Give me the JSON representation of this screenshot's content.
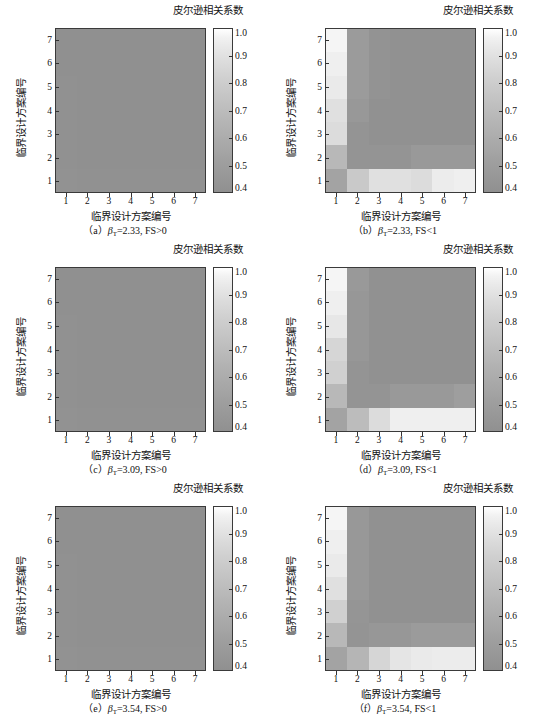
{
  "figure": {
    "width": 539,
    "height": 716,
    "background": "#ffffff"
  },
  "common": {
    "colorbar_title": "皮尔逊相关系数",
    "xlabel": "临界设计方案编号",
    "ylabel": "临界设计方案编号",
    "xticks": [
      "1",
      "2",
      "3",
      "4",
      "5",
      "6",
      "7"
    ],
    "yticks": [
      "1",
      "2",
      "3",
      "4",
      "5",
      "6",
      "7"
    ],
    "cb_ticks": [
      "1.0",
      "0.9",
      "0.8",
      "0.7",
      "0.6",
      "0.5",
      "0.4"
    ],
    "cmap_low_color": "#ffffff",
    "cmap_high_color": "#909090",
    "axes_color": "#3a3a3a"
  },
  "chart_data": [
    {
      "id": "a",
      "type": "heatmap",
      "title": "（a）β_T=2.33, FS>0",
      "caption_prefix": "（a）",
      "caption_beta": "β",
      "caption_beta_sub": "T",
      "caption_rest": "=2.33, FS>0",
      "xlabel": "临界设计方案编号",
      "ylabel": "临界设计方案编号",
      "xticklabels": [
        "1",
        "2",
        "3",
        "4",
        "5",
        "6",
        "7"
      ],
      "yticklabels": [
        "1",
        "2",
        "3",
        "4",
        "5",
        "6",
        "7"
      ],
      "zlim": [
        0.4,
        1.0
      ],
      "colorbar_label": "皮尔逊相关系数",
      "rows_top_to_bottom": [
        7,
        6,
        5,
        4,
        3,
        2,
        1
      ],
      "values": [
        [
          1.0,
          1.0,
          1.0,
          1.0,
          1.0,
          1.0,
          1.0
        ],
        [
          1.0,
          1.0,
          1.0,
          1.0,
          1.0,
          1.0,
          1.0
        ],
        [
          0.995,
          1.0,
          1.0,
          1.0,
          1.0,
          1.0,
          1.0
        ],
        [
          0.995,
          1.0,
          1.0,
          1.0,
          1.0,
          1.0,
          1.0
        ],
        [
          0.99,
          1.0,
          1.0,
          1.0,
          1.0,
          1.0,
          1.0
        ],
        [
          0.99,
          1.0,
          1.0,
          1.0,
          1.0,
          1.0,
          1.0
        ],
        [
          0.985,
          0.99,
          0.99,
          0.99,
          0.99,
          0.99,
          0.99
        ]
      ]
    },
    {
      "id": "b",
      "type": "heatmap",
      "title": "（b）β_T=2.33, FS<1",
      "caption_prefix": "（b）",
      "caption_beta": "β",
      "caption_beta_sub": "T",
      "caption_rest": "=2.33, FS<1",
      "xlabel": "临界设计方案编号",
      "ylabel": "临界设计方案编号",
      "xticklabels": [
        "1",
        "2",
        "3",
        "4",
        "5",
        "6",
        "7"
      ],
      "yticklabels": [
        "1",
        "2",
        "3",
        "4",
        "5",
        "6",
        "7"
      ],
      "zlim": [
        0.4,
        1.0
      ],
      "colorbar_label": "皮尔逊相关系数",
      "rows_top_to_bottom": [
        7,
        6,
        5,
        4,
        3,
        2,
        1
      ],
      "values": [
        [
          0.42,
          0.92,
          0.98,
          0.99,
          0.99,
          0.99,
          0.99
        ],
        [
          0.44,
          0.92,
          0.98,
          0.99,
          0.99,
          0.99,
          0.99
        ],
        [
          0.46,
          0.92,
          0.98,
          0.99,
          0.99,
          0.99,
          0.99
        ],
        [
          0.5,
          0.94,
          0.99,
          0.99,
          0.99,
          0.99,
          0.99
        ],
        [
          0.52,
          0.97,
          0.99,
          0.99,
          0.99,
          0.99,
          0.99
        ],
        [
          0.72,
          0.97,
          0.97,
          0.97,
          0.93,
          0.93,
          0.93
        ],
        [
          0.86,
          0.62,
          0.5,
          0.5,
          0.52,
          0.45,
          0.44
        ]
      ]
    },
    {
      "id": "c",
      "type": "heatmap",
      "title": "（c）β_T=3.09, FS>0",
      "caption_prefix": "（c）",
      "caption_beta": "β",
      "caption_beta_sub": "T",
      "caption_rest": "=3.09, FS>0",
      "xlabel": "临界设计方案编号",
      "ylabel": "临界设计方案编号",
      "xticklabels": [
        "1",
        "2",
        "3",
        "4",
        "5",
        "6",
        "7"
      ],
      "yticklabels": [
        "1",
        "2",
        "3",
        "4",
        "5",
        "6",
        "7"
      ],
      "zlim": [
        0.4,
        1.0
      ],
      "colorbar_label": "皮尔逊相关系数",
      "rows_top_to_bottom": [
        7,
        6,
        5,
        4,
        3,
        2,
        1
      ],
      "values": [
        [
          1.0,
          1.0,
          1.0,
          1.0,
          1.0,
          1.0,
          1.0
        ],
        [
          1.0,
          1.0,
          1.0,
          1.0,
          1.0,
          1.0,
          1.0
        ],
        [
          0.995,
          1.0,
          1.0,
          1.0,
          1.0,
          1.0,
          1.0
        ],
        [
          0.995,
          1.0,
          1.0,
          1.0,
          1.0,
          1.0,
          1.0
        ],
        [
          0.99,
          1.0,
          1.0,
          1.0,
          1.0,
          1.0,
          1.0
        ],
        [
          0.99,
          1.0,
          1.0,
          1.0,
          1.0,
          1.0,
          1.0
        ],
        [
          0.985,
          0.99,
          0.99,
          0.99,
          0.99,
          0.99,
          0.99
        ]
      ]
    },
    {
      "id": "d",
      "type": "heatmap",
      "title": "（d）β_T=3.09, FS<1",
      "caption_prefix": "（d）",
      "caption_beta": "β",
      "caption_beta_sub": "T",
      "caption_rest": "=3.09, FS<1",
      "xlabel": "临界设计方案编号",
      "ylabel": "临界设计方案编号",
      "xticklabels": [
        "1",
        "2",
        "3",
        "4",
        "5",
        "6",
        "7"
      ],
      "yticklabels": [
        "1",
        "2",
        "3",
        "4",
        "5",
        "6",
        "7"
      ],
      "zlim": [
        0.4,
        1.0
      ],
      "colorbar_label": "皮尔逊相关系数",
      "rows_top_to_bottom": [
        7,
        6,
        5,
        4,
        3,
        2,
        1
      ],
      "values": [
        [
          0.42,
          0.93,
          0.99,
          0.99,
          0.99,
          0.99,
          0.99
        ],
        [
          0.44,
          0.95,
          0.99,
          0.99,
          0.99,
          0.99,
          0.99
        ],
        [
          0.47,
          0.95,
          0.99,
          0.99,
          0.99,
          0.99,
          0.99
        ],
        [
          0.55,
          0.95,
          0.99,
          0.99,
          0.99,
          0.99,
          0.99
        ],
        [
          0.58,
          0.97,
          0.99,
          0.99,
          0.99,
          0.99,
          0.99
        ],
        [
          0.72,
          0.97,
          0.97,
          0.93,
          0.93,
          0.93,
          0.9
        ],
        [
          0.86,
          0.7,
          0.52,
          0.44,
          0.44,
          0.44,
          0.44
        ]
      ]
    },
    {
      "id": "e",
      "type": "heatmap",
      "title": "（e）β_T=3.54, FS>0",
      "caption_prefix": "（e）",
      "caption_beta": "β",
      "caption_beta_sub": "T",
      "caption_rest": "=3.54, FS>0",
      "xlabel": "临界设计方案编号",
      "ylabel": "临界设计方案编号",
      "xticklabels": [
        "1",
        "2",
        "3",
        "4",
        "5",
        "6",
        "7"
      ],
      "yticklabels": [
        "1",
        "2",
        "3",
        "4",
        "5",
        "6",
        "7"
      ],
      "zlim": [
        0.4,
        1.0
      ],
      "colorbar_label": "皮尔逊相关系数",
      "rows_top_to_bottom": [
        7,
        6,
        5,
        4,
        3,
        2,
        1
      ],
      "values": [
        [
          1.0,
          1.0,
          1.0,
          1.0,
          1.0,
          1.0,
          1.0
        ],
        [
          1.0,
          1.0,
          1.0,
          1.0,
          1.0,
          1.0,
          1.0
        ],
        [
          0.995,
          1.0,
          1.0,
          1.0,
          1.0,
          1.0,
          1.0
        ],
        [
          0.995,
          1.0,
          1.0,
          1.0,
          1.0,
          1.0,
          1.0
        ],
        [
          0.99,
          1.0,
          1.0,
          1.0,
          1.0,
          1.0,
          1.0
        ],
        [
          0.99,
          1.0,
          1.0,
          1.0,
          1.0,
          1.0,
          1.0
        ],
        [
          0.985,
          0.99,
          0.99,
          0.99,
          0.99,
          0.99,
          0.99
        ]
      ]
    },
    {
      "id": "f",
      "type": "heatmap",
      "title": "（f）β_T=3.54, FS<1",
      "caption_prefix": "（f）",
      "caption_beta": "β",
      "caption_beta_sub": "T",
      "caption_rest": "=3.54, FS<1",
      "xlabel": "临界设计方案编号",
      "ylabel": "临界设计方案编号",
      "xticklabels": [
        "1",
        "2",
        "3",
        "4",
        "5",
        "6",
        "7"
      ],
      "yticklabels": [
        "1",
        "2",
        "3",
        "4",
        "5",
        "6",
        "7"
      ],
      "zlim": [
        0.4,
        1.0
      ],
      "colorbar_label": "皮尔逊相关系数",
      "rows_top_to_bottom": [
        7,
        6,
        5,
        4,
        3,
        2,
        1
      ],
      "values": [
        [
          0.42,
          0.94,
          0.99,
          0.99,
          0.99,
          0.99,
          0.99
        ],
        [
          0.44,
          0.94,
          0.99,
          0.99,
          0.99,
          0.99,
          0.99
        ],
        [
          0.46,
          0.94,
          0.99,
          0.99,
          0.99,
          0.99,
          0.99
        ],
        [
          0.5,
          0.94,
          0.99,
          0.99,
          0.99,
          0.99,
          0.99
        ],
        [
          0.58,
          0.96,
          0.99,
          0.99,
          0.99,
          0.99,
          0.99
        ],
        [
          0.72,
          0.97,
          0.95,
          0.95,
          0.92,
          0.92,
          0.92
        ],
        [
          0.86,
          0.74,
          0.55,
          0.48,
          0.46,
          0.45,
          0.45
        ]
      ]
    }
  ]
}
